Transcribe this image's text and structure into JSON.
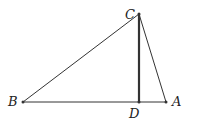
{
  "diagram": {
    "type": "geometry-triangle",
    "points": {
      "A": {
        "label": "A",
        "x": 166,
        "y": 102
      },
      "B": {
        "label": "B",
        "x": 23,
        "y": 102
      },
      "C": {
        "label": "C",
        "x": 139,
        "y": 14
      },
      "D": {
        "label": "D",
        "x": 139,
        "y": 102
      }
    },
    "segments": [
      {
        "from": "B",
        "to": "C"
      },
      {
        "from": "C",
        "to": "A"
      },
      {
        "from": "B",
        "to": "A"
      },
      {
        "from": "C",
        "to": "D",
        "emphasis": "bold"
      }
    ],
    "colors": {
      "line": "#333333",
      "label": "#222222"
    }
  }
}
